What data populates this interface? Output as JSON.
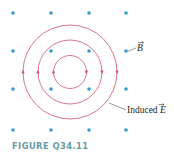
{
  "figure": {
    "caption": "FIGURE Q34.11",
    "field_label": "B",
    "field_label_vector": true,
    "induced_label": "Induced E",
    "induced_label_prefix": "Induced ",
    "induced_label_symbol": "E",
    "colors": {
      "dot": "#3a9ad9",
      "loop": "#d0546e",
      "caption": "#6a9aa6",
      "leader": "#555555"
    },
    "dots": {
      "cols_x": [
        13,
        51,
        89,
        126
      ],
      "rows_y": [
        13,
        51,
        89,
        130
      ]
    },
    "loops": {
      "center": [
        70,
        72
      ],
      "radii": [
        16.5,
        32,
        47
      ],
      "circulation": "clockwise"
    }
  }
}
